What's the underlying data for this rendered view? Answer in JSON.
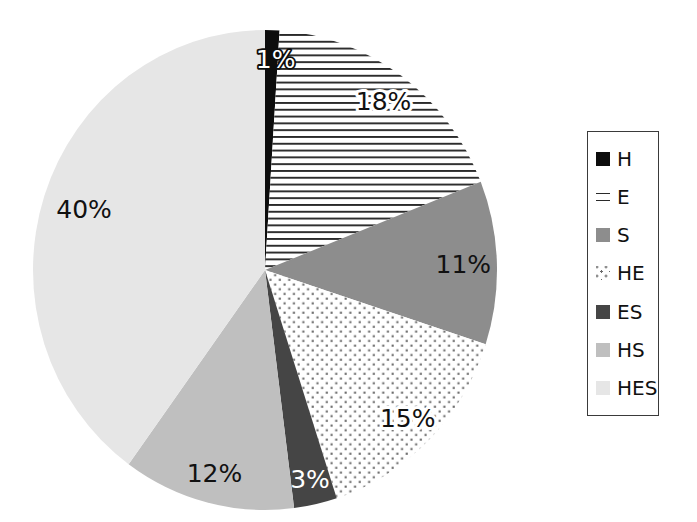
{
  "chart_data": {
    "type": "pie",
    "title": "",
    "background": "#ffffff",
    "legend_position": "right",
    "start_angle_deg": 0,
    "direction": "clockwise",
    "categories": [
      "H",
      "E",
      "S",
      "HE",
      "ES",
      "HS",
      "HES"
    ],
    "values": [
      1,
      18,
      11,
      15,
      3,
      12,
      40
    ],
    "slices": [
      {
        "name": "H",
        "value": 1,
        "label": "1%",
        "fill": "solid",
        "color": "#0d0d0d",
        "label_style": "outline"
      },
      {
        "name": "E",
        "value": 18,
        "label": "18%",
        "fill": "hlines",
        "color": "#2a2a2a",
        "label_style": "halo"
      },
      {
        "name": "S",
        "value": 11,
        "label": "11%",
        "fill": "solid",
        "color": "#8d8d8d",
        "label_style": "plain"
      },
      {
        "name": "HE",
        "value": 15,
        "label": "15%",
        "fill": "dots",
        "color": "#6a6a6a",
        "label_style": "halo"
      },
      {
        "name": "ES",
        "value": 3,
        "label": "3%",
        "fill": "solid",
        "color": "#454545",
        "label_style": "white"
      },
      {
        "name": "HS",
        "value": 12,
        "label": "12%",
        "fill": "solid",
        "color": "#bfbfbf",
        "label_style": "plain"
      },
      {
        "name": "HES",
        "value": 40,
        "label": "40%",
        "fill": "solid",
        "color": "#e6e6e6",
        "label_style": "plain"
      }
    ]
  }
}
